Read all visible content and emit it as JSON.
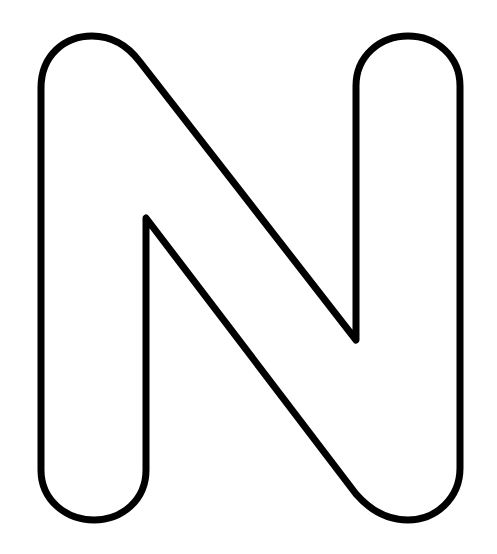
{
  "figure": {
    "letter": "N",
    "style": "outline",
    "stroke_color": "#000000",
    "fill_color": "#ffffff",
    "background": "#ffffff"
  }
}
